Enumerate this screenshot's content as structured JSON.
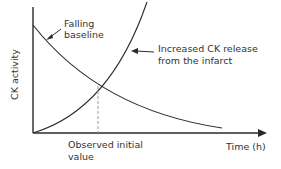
{
  "diagram": {
    "y_axis_label": "CK activity",
    "x_axis_label": "Time (h)",
    "annotations": {
      "falling": [
        "Falling",
        "baseline"
      ],
      "increased": [
        "Increased  CK  release",
        "from the infarct"
      ],
      "observed": [
        "Observed initial",
        "value"
      ]
    },
    "curves": [
      {
        "name": "Falling baseline",
        "shape": "decreasing convex"
      },
      {
        "name": "Increased CK release from the infarct",
        "shape": "increasing convex"
      }
    ],
    "colors": {
      "line": "#2a2a2a",
      "dashed": "#9a9a9a",
      "text": "#333333"
    }
  }
}
